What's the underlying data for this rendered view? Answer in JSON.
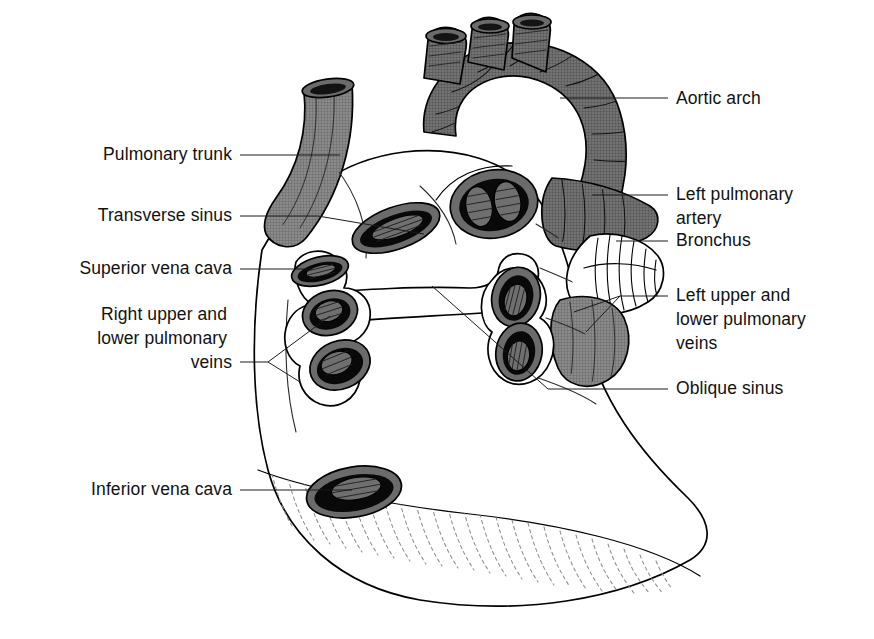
{
  "figure": {
    "background_color": "#ffffff",
    "ink_color": "#000000",
    "vessel_gray": "#7a7a7a",
    "lumen_dark": "#0a0a0a",
    "lumen_gray": "#6f6f6f",
    "hatch_gray": "#8d8d8d"
  },
  "labels_left": [
    {
      "id": "pulmonary-trunk",
      "lines": [
        "Pulmonary trunk"
      ],
      "text_x": 232,
      "text_y": 160
    },
    {
      "id": "transverse-sinus",
      "lines": [
        "Transverse sinus"
      ],
      "text_x": 232,
      "text_y": 221
    },
    {
      "id": "superior-vena-cava",
      "lines": [
        "Superior vena cava"
      ],
      "text_x": 232,
      "text_y": 274
    },
    {
      "id": "right-pulmonary-veins",
      "lines": [
        "Right upper and",
        "lower pulmonary",
        "veins"
      ],
      "text_x": 232,
      "text_y": 320
    },
    {
      "id": "inferior-vena-cava",
      "lines": [
        "Inferior vena cava"
      ],
      "text_x": 232,
      "text_y": 495
    }
  ],
  "labels_right": [
    {
      "id": "aortic-arch",
      "lines": [
        "Aortic arch"
      ],
      "text_x": 676,
      "text_y": 104
    },
    {
      "id": "left-pulmonary-artery",
      "lines": [
        "Left pulmonary",
        "artery"
      ],
      "text_x": 676,
      "text_y": 200
    },
    {
      "id": "bronchus",
      "lines": [
        "Bronchus"
      ],
      "text_x": 676,
      "text_y": 246
    },
    {
      "id": "left-pulmonary-veins",
      "lines": [
        "Left upper and",
        "lower pulmonary",
        "veins"
      ],
      "text_x": 676,
      "text_y": 301
    },
    {
      "id": "oblique-sinus",
      "lines": [
        "Oblique sinus"
      ],
      "text_x": 676,
      "text_y": 394
    }
  ],
  "structures": [
    {
      "id": "aortic-arch",
      "name": "Aortic arch",
      "side": "superior",
      "fill": "gray"
    },
    {
      "id": "brachiocephalic-trunk",
      "name": "Brachiocephalic branch stump",
      "side": "superior",
      "fill": "gray"
    },
    {
      "id": "left-common-carotid",
      "name": "Left common carotid stump",
      "side": "superior",
      "fill": "gray"
    },
    {
      "id": "left-subclavian",
      "name": "Left subclavian stump",
      "side": "superior",
      "fill": "gray"
    },
    {
      "id": "pulmonary-trunk",
      "name": "Pulmonary trunk (cut)",
      "side": "left",
      "fill": "gray"
    },
    {
      "id": "aorta-orifice",
      "name": "Aorta cut orifice",
      "side": "centre",
      "fill": "dark"
    },
    {
      "id": "pulmonary-orifice",
      "name": "Pulmonary artery cut orifice",
      "side": "centre",
      "fill": "dark"
    },
    {
      "id": "superior-vena-cava",
      "name": "Superior vena cava orifice",
      "side": "right",
      "fill": "dark"
    },
    {
      "id": "right-upper-pv",
      "name": "Right upper pulmonary vein orifice",
      "side": "right",
      "fill": "dark"
    },
    {
      "id": "right-lower-pv",
      "name": "Right lower pulmonary vein orifice",
      "side": "right",
      "fill": "dark"
    },
    {
      "id": "left-upper-pv",
      "name": "Left upper pulmonary vein orifice",
      "side": "left",
      "fill": "dark"
    },
    {
      "id": "left-lower-pv",
      "name": "Left lower pulmonary vein orifice",
      "side": "left",
      "fill": "dark"
    },
    {
      "id": "inferior-vena-cava",
      "name": "Inferior vena cava orifice",
      "side": "inferior",
      "fill": "dark"
    },
    {
      "id": "bronchus",
      "name": "Left main bronchus with cartilage rings",
      "side": "left",
      "fill": "white"
    },
    {
      "id": "oblique-sinus",
      "name": "Oblique pericardial sinus reflection",
      "side": "centre",
      "fill": "white"
    },
    {
      "id": "transverse-sinus",
      "name": "Transverse pericardial sinus",
      "side": "centre",
      "fill": "white"
    },
    {
      "id": "diaphragmatic-surface",
      "name": "Diaphragmatic surface (hatched)",
      "side": "inferior",
      "fill": "hatched"
    }
  ]
}
